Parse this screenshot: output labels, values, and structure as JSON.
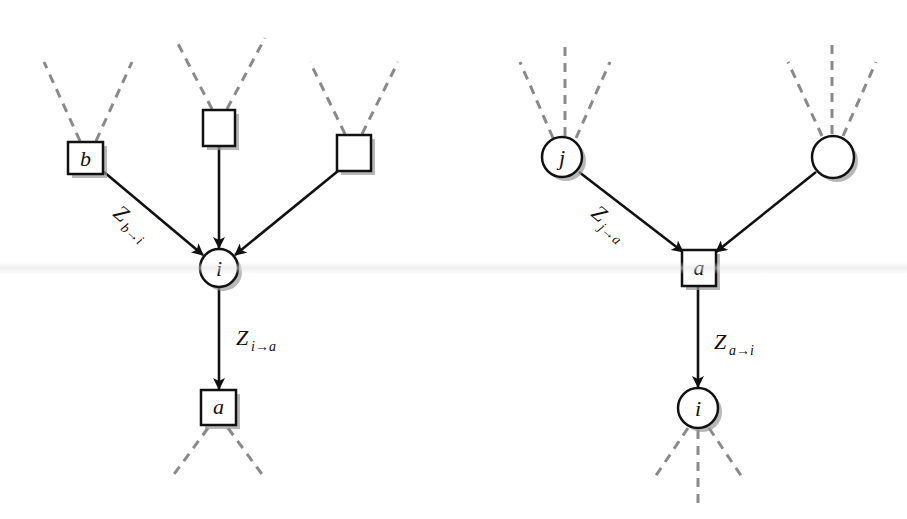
{
  "diagram": {
    "title": "",
    "colors": {
      "stroke": "#111111",
      "dashed": "#8a8a8a",
      "shadow": "#9a9a9a",
      "fill": "#ffffff"
    },
    "left": {
      "description": "Variable-to-factor message: incoming factor messages into variable i, outgoing message to factor a",
      "nodes": {
        "b": {
          "shape": "square",
          "label": "b"
        },
        "top_mid": {
          "shape": "square",
          "label": ""
        },
        "top_right": {
          "shape": "square",
          "label": ""
        },
        "i": {
          "shape": "circle",
          "label": "i"
        },
        "a": {
          "shape": "square",
          "label": "a"
        }
      },
      "edges": [
        {
          "from": "b",
          "to": "i",
          "label_main": "Z",
          "label_sub": "b→i"
        },
        {
          "from": "top_mid",
          "to": "i",
          "label_main": "",
          "label_sub": ""
        },
        {
          "from": "top_right",
          "to": "i",
          "label_main": "",
          "label_sub": ""
        },
        {
          "from": "i",
          "to": "a",
          "label_main": "Z",
          "label_sub": "i→a"
        }
      ]
    },
    "right": {
      "description": "Factor-to-variable message: incoming variable messages into factor a, outgoing message to variable i",
      "nodes": {
        "j": {
          "shape": "circle",
          "label": "j"
        },
        "top_right": {
          "shape": "circle",
          "label": ""
        },
        "a": {
          "shape": "square",
          "label": "a"
        },
        "i": {
          "shape": "circle",
          "label": "i"
        }
      },
      "edges": [
        {
          "from": "j",
          "to": "a",
          "label_main": "Z",
          "label_sub": "j→a"
        },
        {
          "from": "top_right",
          "to": "a",
          "label_main": "",
          "label_sub": ""
        },
        {
          "from": "a",
          "to": "i",
          "label_main": "Z",
          "label_sub": "a→i"
        }
      ]
    }
  }
}
